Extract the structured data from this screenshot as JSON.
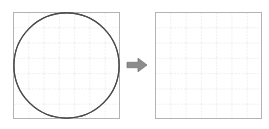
{
  "figure": {
    "title": "Inscribed circle with four-arc star, and empty grid to copy onto",
    "arrow_icon": "right-arrow-icon",
    "arrow_label": "copy to",
    "colors": {
      "background": "#ffffff",
      "panel_border": "#b3b3b3",
      "grid_line": "#c9c9d6",
      "figure_stroke": "#4a4a4a",
      "arrow_fill": "#8c8c8c",
      "arrow_stroke": "#6e6e6e"
    },
    "grid": {
      "columns": 7,
      "rows": 7,
      "cell_size": 15.2857,
      "style": "dashed",
      "visible": true
    },
    "panels": [
      {
        "id": "source-panel",
        "name": "source-figure-panel",
        "label": "Source figure",
        "has_drawing": true,
        "shapes": [
          {
            "name": "bounding-square",
            "type": "square",
            "x": 0,
            "y": 0,
            "width": 107,
            "height": 107
          },
          {
            "name": "inscribed-circle",
            "type": "circle",
            "cx": 53.5,
            "cy": 53.5,
            "r": 53.5
          },
          {
            "name": "arc-top-left",
            "type": "arc",
            "center_corner": "top-left",
            "cx": 0,
            "cy": 0,
            "r": 53.5,
            "from": [
              53.5,
              0
            ],
            "to": [
              0,
              53.5
            ]
          },
          {
            "name": "arc-top-right",
            "type": "arc",
            "center_corner": "top-right",
            "cx": 107,
            "cy": 0,
            "r": 53.5,
            "from": [
              53.5,
              0
            ],
            "to": [
              107,
              53.5
            ]
          },
          {
            "name": "arc-bottom-right",
            "type": "arc",
            "center_corner": "bottom-right",
            "cx": 107,
            "cy": 107,
            "r": 53.5,
            "from": [
              107,
              53.5
            ],
            "to": [
              53.5,
              107
            ]
          },
          {
            "name": "arc-bottom-left",
            "type": "arc",
            "center_corner": "bottom-left",
            "cx": 0,
            "cy": 107,
            "r": 53.5,
            "from": [
              53.5,
              107
            ],
            "to": [
              0,
              53.5
            ]
          }
        ],
        "cusps": [
          "top-center",
          "right-center",
          "bottom-center",
          "left-center"
        ]
      },
      {
        "id": "target-panel",
        "name": "target-blank-panel",
        "label": "Blank grid",
        "has_drawing": false,
        "shapes": [
          {
            "name": "bounding-square",
            "type": "square",
            "x": 0,
            "y": 0,
            "width": 107,
            "height": 107
          }
        ]
      }
    ]
  }
}
